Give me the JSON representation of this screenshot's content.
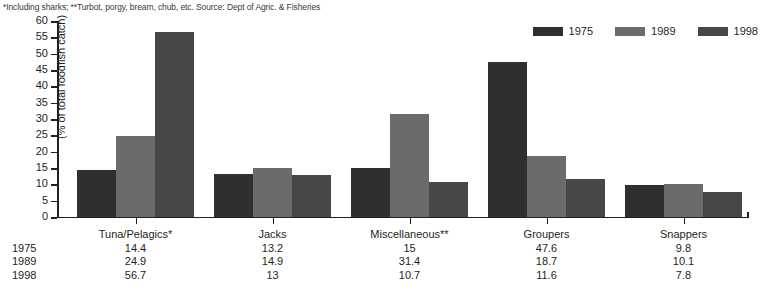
{
  "footnote": "*Including sharks; **Turbot, porgy, bream, chub, etc. Source: Dept of Agric. & Fisheries",
  "legend": {
    "items": [
      {
        "label": "1975",
        "color": "#2f2f2f"
      },
      {
        "label": "1989",
        "color": "#6b6b6b"
      },
      {
        "label": "1998",
        "color": "#474747"
      }
    ]
  },
  "axis": {
    "y_title": "(% of total foodfish catch)",
    "y_ticks": [
      "60",
      "55",
      "50",
      "45",
      "40",
      "35",
      "30",
      "25",
      "20",
      "15",
      "10",
      "5",
      "0"
    ]
  },
  "table": {
    "row_heads": [
      "1975",
      "1989",
      "1998"
    ],
    "categories": [
      "Tuna/Pelagics*",
      "Jacks",
      "Miscellaneous**",
      "Groupers",
      "Snappers"
    ],
    "rows": [
      [
        "14.4",
        "13.2",
        "15",
        "47.6",
        "9.8"
      ],
      [
        "24.9",
        "14.9",
        "31.4",
        "18.7",
        "10.1"
      ],
      [
        "56.7",
        "13",
        "10.7",
        "11.6",
        "7.8"
      ]
    ]
  },
  "chart_data": {
    "type": "bar",
    "title": "",
    "xlabel": "",
    "ylabel": "(% of total foodfish catch)",
    "ylim": [
      0,
      60
    ],
    "ytick_step": 5,
    "grid": false,
    "legend_position": "top-right",
    "categories": [
      "Tuna/Pelagics*",
      "Jacks",
      "Miscellaneous**",
      "Groupers",
      "Snappers"
    ],
    "series": [
      {
        "name": "1975",
        "color": "#2f2f2f",
        "values": [
          14.4,
          13.2,
          15,
          47.6,
          9.8
        ]
      },
      {
        "name": "1989",
        "color": "#6b6b6b",
        "values": [
          24.9,
          14.9,
          31.4,
          18.7,
          10.1
        ]
      },
      {
        "name": "1998",
        "color": "#474747",
        "values": [
          56.7,
          13,
          10.7,
          11.6,
          7.8
        ]
      }
    ],
    "annotations": [
      "*Including sharks; **Turbot, porgy, bream, chub, etc. Source: Dept of Agric. & Fisheries"
    ]
  }
}
